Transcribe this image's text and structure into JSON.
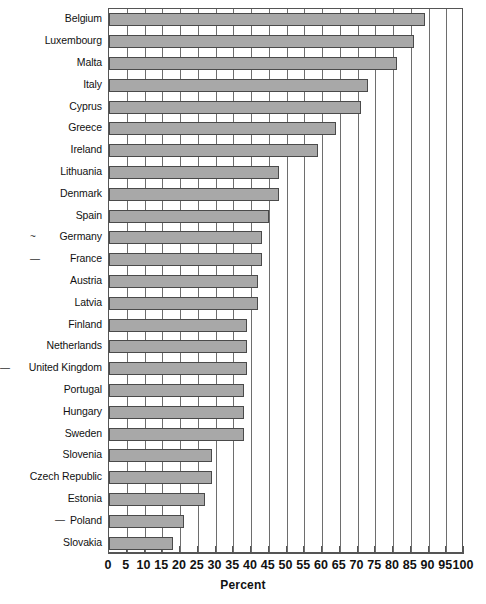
{
  "chart_data": {
    "type": "bar",
    "orientation": "horizontal",
    "title": "",
    "subtitle": "",
    "xlabel": "Percent",
    "ylabel": "",
    "xlim": [
      0,
      100
    ],
    "xticks": [
      0,
      5,
      10,
      15,
      20,
      25,
      30,
      35,
      40,
      45,
      50,
      55,
      60,
      65,
      70,
      75,
      80,
      85,
      90,
      95,
      100
    ],
    "xtick_labels": [
      "0",
      "5",
      "10",
      "15",
      "20",
      "25",
      "30",
      "35",
      "40",
      "45",
      "50",
      "55",
      "60",
      "65",
      "70",
      "75",
      "80",
      "85",
      "90",
      "95",
      "100"
    ],
    "grid": true,
    "grid_axis": "x",
    "legend": false,
    "legend_position": "none",
    "bar_fill_color": "#a8a8a8",
    "bar_edge_color": "#4a4a4a",
    "categories": [
      "Belgium",
      "Luxembourg",
      "Malta",
      "Italy",
      "Cyprus",
      "Greece",
      "Ireland",
      "Lithuania",
      "Denmark",
      "Spain",
      "Germany",
      "France",
      "Austria",
      "Latvia",
      "Finland",
      "Netherlands",
      "United Kingdom",
      "Portugal",
      "Hungary",
      "Sweden",
      "Slovenia",
      "Czech Republic",
      "Estonia",
      "Poland",
      "Slovakia"
    ],
    "values": [
      89,
      86,
      81,
      73,
      71,
      64,
      59,
      48,
      48,
      45,
      43,
      43,
      42,
      42,
      39,
      39,
      39,
      38,
      38,
      38,
      29,
      29,
      27,
      21,
      18
    ],
    "annotations": [
      {
        "category": "Germany",
        "marker": "~"
      },
      {
        "category": "France",
        "marker": "—"
      },
      {
        "category": "United Kingdom",
        "marker": "—"
      },
      {
        "category": "Poland",
        "marker": "—"
      }
    ]
  }
}
